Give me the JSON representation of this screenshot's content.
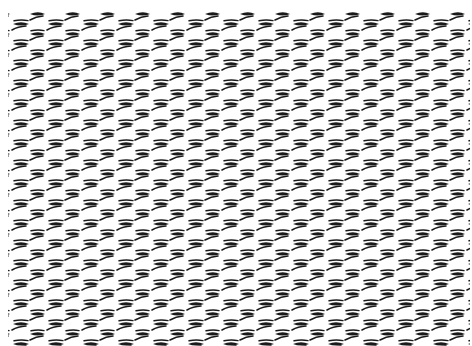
{
  "image": {
    "description": "Black-and-white repeating texture of short dash/lens marks arranged in offset diagonal rows (mesh / woven pattern)",
    "background": "#ffffff",
    "ink": "#1a1a1a",
    "pattern": {
      "period_x": 35,
      "period_y": 20,
      "origin_x": 10,
      "origin_y": 14
    }
  }
}
